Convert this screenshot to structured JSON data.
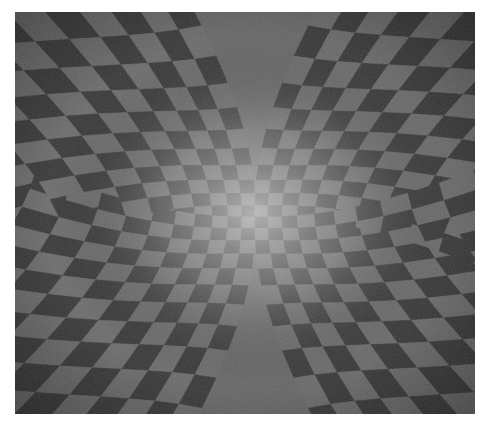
{
  "image": {
    "description": "Grayscale op-art painting of a warped checkerboard that bulges into a glowing center, with four quadrants of stripes bending in different directions",
    "colors": {
      "background": "#ffffff",
      "dark_tile": "#3a3a3a",
      "mid_tile": "#6e6e6e",
      "light_tile": "#9a9a9a",
      "center_glow": "#c8c8c8"
    },
    "bounds": {
      "x": 15,
      "y": 12,
      "width": 460,
      "height": 402
    }
  }
}
